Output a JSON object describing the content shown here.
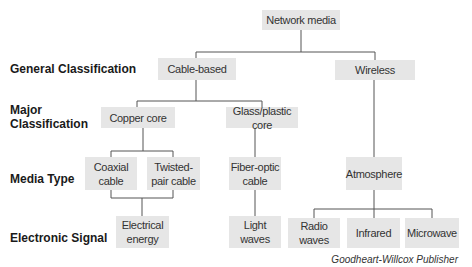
{
  "row_labels": {
    "general": "General Classification",
    "major_1": "Major",
    "major_2": "Classification",
    "media_type": "Media Type",
    "signal": "Electronic Signal"
  },
  "nodes": {
    "root": "Network media",
    "cable": "Cable-based",
    "wireless": "Wireless",
    "copper": "Copper core",
    "glass": "Glass/plastic core",
    "coax_1": "Coaxial",
    "coax_2": "cable",
    "twisted_1": "Twisted-",
    "twisted_2": "pair cable",
    "fiber_1": "Fiber-optic",
    "fiber_2": "cable",
    "atmosphere": "Atmosphere",
    "electrical_1": "Electrical",
    "electrical_2": "energy",
    "light_1": "Light",
    "light_2": "waves",
    "radio_1": "Radio",
    "radio_2": "waves",
    "infrared": "Infrared",
    "microwave": "Microwave"
  },
  "credit": "Goodheart-Willcox Publisher",
  "colors": {
    "box": "#e6e6e6",
    "line": "#555555"
  }
}
